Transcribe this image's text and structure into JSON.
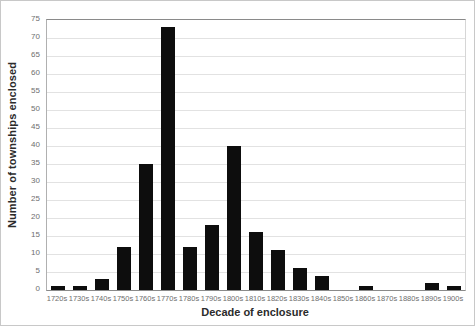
{
  "chart_data": {
    "type": "bar",
    "title": "",
    "xlabel": "Decade of enclosure",
    "ylabel": "Number of townships enclosed",
    "categories": [
      "1720s",
      "1730s",
      "1740s",
      "1750s",
      "1760s",
      "1770s",
      "1780s",
      "1790s",
      "1800s",
      "1810s",
      "1820s",
      "1830s",
      "1840s",
      "1850s",
      "1860s",
      "1870s",
      "1880s",
      "1890s",
      "1900s"
    ],
    "values": [
      1,
      1,
      3,
      12,
      35,
      73,
      12,
      18,
      40,
      16,
      11,
      6,
      4,
      0,
      1,
      0,
      0,
      2,
      1
    ],
    "ylim": [
      0,
      75
    ],
    "ytick_step": 5,
    "yticks": [
      "75",
      "70",
      "65",
      "60",
      "55",
      "50",
      "45",
      "40",
      "35",
      "30",
      "25",
      "20",
      "15",
      "10",
      "5",
      "0"
    ],
    "grid": true,
    "legend": "none",
    "bar_color": "#0d0d0d",
    "gridline_color": "#e2e2e2",
    "axis_color": "#8a8a8a",
    "tick_label_color": "#6e6e6e",
    "axis_title_color": "#2b2b2b",
    "background_color": "#ffffff"
  }
}
